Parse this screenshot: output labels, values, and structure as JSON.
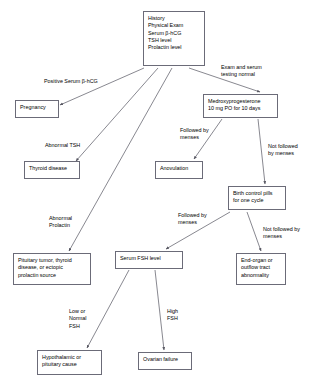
{
  "diagram": {
    "colors": {
      "box_border": "#6b6b78",
      "edge_line": "#555560",
      "background": "#ffffff",
      "text": "#000000"
    },
    "nodes": [
      {
        "id": "initial-workup",
        "text": "History\nPhysical Exam\nSerum β-hCG\nTSH level\n Prolactin level",
        "x": 143,
        "y": 11,
        "w": 62,
        "h": 55
      },
      {
        "id": "pregnancy",
        "text": "Pregnancy",
        "x": 15,
        "y": 100,
        "w": 44,
        "h": 18
      },
      {
        "id": "thyroid-disease",
        "text": "Thyroid disease",
        "x": 24,
        "y": 161,
        "w": 56,
        "h": 18
      },
      {
        "id": "pituitary-tumor",
        "text": "Pituitary tumor, thyroid\ndisease, or ectopic\nprolactin source",
        "x": 13,
        "y": 253,
        "w": 78,
        "h": 32
      },
      {
        "id": "medroxyprogesterone",
        "text": "Medroxyprogesterone\n10 mg PO for 10 days",
        "x": 203,
        "y": 94,
        "w": 75,
        "h": 24
      },
      {
        "id": "anovulation",
        "text": "Anovulation",
        "x": 155,
        "y": 161,
        "w": 48,
        "h": 18
      },
      {
        "id": "birth-control-pills",
        "text": "Birth control pills\nfor one cycle",
        "x": 228,
        "y": 186,
        "w": 58,
        "h": 24
      },
      {
        "id": "end-organ-abnormality",
        "text": "End-organ or\noutflow tract\nabnormality",
        "x": 236,
        "y": 253,
        "w": 50,
        "h": 32
      },
      {
        "id": "serum-fsh-level",
        "text": "Serum FSH level",
        "x": 115,
        "y": 251,
        "w": 68,
        "h": 18
      },
      {
        "id": "hypothalamic-pituitary-cause",
        "text": "Hypothalamic or\npituitary cause",
        "x": 37,
        "y": 350,
        "w": 65,
        "h": 25
      },
      {
        "id": "ovarian-failure",
        "text": "Ovarian failure",
        "x": 138,
        "y": 352,
        "w": 54,
        "h": 18
      }
    ],
    "edges": [
      {
        "id": "initial-to-pregnancy",
        "from": "initial-workup",
        "to": "pregnancy",
        "label": "Positive Serum β-hCG",
        "label_x": 44,
        "label_y": 78,
        "x1": 144,
        "y1": 68,
        "x2": 60,
        "y2": 105
      },
      {
        "id": "initial-to-thyroid",
        "from": "initial-workup",
        "to": "thyroid-disease",
        "label": "Abnormal TSH",
        "label_x": 45,
        "label_y": 142,
        "x1": 158,
        "y1": 68,
        "x2": 76,
        "y2": 161
      },
      {
        "id": "initial-to-pituitary",
        "from": "initial-workup",
        "to": "pituitary-tumor",
        "label": "Abnormal\nProlactin",
        "label_x": 49,
        "label_y": 215,
        "x1": 172,
        "y1": 68,
        "x2": 69,
        "y2": 251
      },
      {
        "id": "initial-to-medroxyprogesterone",
        "from": "initial-workup",
        "to": "medroxyprogesterone",
        "label": "Exam and serum\ntesting normal",
        "label_x": 221,
        "label_y": 64,
        "x1": 189,
        "y1": 68,
        "x2": 260,
        "y2": 92
      },
      {
        "id": "medroxy-to-anovulation",
        "from": "medroxyprogesterone",
        "to": "anovulation",
        "label": "Followed by\nmenses",
        "label_x": 180,
        "label_y": 127,
        "x1": 222,
        "y1": 119,
        "x2": 194,
        "y2": 159
      },
      {
        "id": "medroxy-to-bcp",
        "from": "medroxyprogesterone",
        "to": "birth-control-pills",
        "label": "Not followed\nby menses",
        "label_x": 268,
        "label_y": 143,
        "x1": 258,
        "y1": 119,
        "x2": 265,
        "y2": 184
      },
      {
        "id": "bcp-to-fsh",
        "from": "birth-control-pills",
        "to": "serum-fsh-level",
        "label": "Followed by\nmenses",
        "label_x": 178,
        "label_y": 212,
        "x1": 230,
        "y1": 212,
        "x2": 166,
        "y2": 249
      },
      {
        "id": "bcp-to-end-organ",
        "from": "birth-control-pills",
        "to": "end-organ-abnormality",
        "label": "Not followed by\nmenses",
        "label_x": 263,
        "label_y": 226,
        "x1": 247,
        "y1": 212,
        "x2": 261,
        "y2": 251
      },
      {
        "id": "fsh-to-hypothalamic",
        "from": "serum-fsh-level",
        "to": "hypothalamic-pituitary-cause",
        "label": "Low or\nNormal\nFSH",
        "label_x": 69,
        "label_y": 308,
        "x1": 129,
        "y1": 270,
        "x2": 87,
        "y2": 348
      },
      {
        "id": "fsh-to-ovarian-failure",
        "from": "serum-fsh-level",
        "to": "ovarian-failure",
        "label": "High\nFSH",
        "label_x": 167,
        "label_y": 308,
        "x1": 155,
        "y1": 270,
        "x2": 164,
        "y2": 350
      }
    ]
  }
}
